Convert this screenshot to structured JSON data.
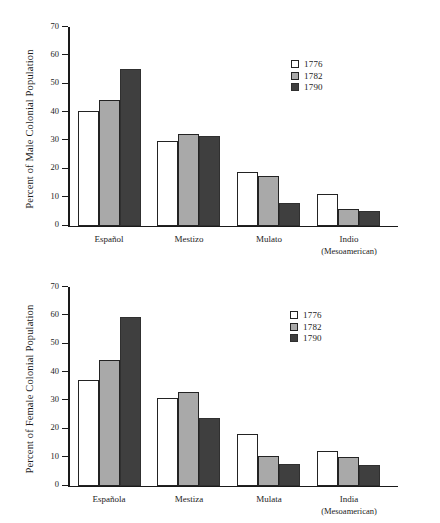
{
  "figure": {
    "background": "#ffffff",
    "series_colors": [
      "#ffffff",
      "#a9a9a9",
      "#3f3f3f"
    ]
  },
  "chart_data": [
    {
      "type": "bar",
      "id": "male",
      "title": "",
      "xlabel": "",
      "ylabel": "Percent of Male Colonial Population",
      "ylim": [
        0,
        70
      ],
      "yticks": [
        0,
        10,
        20,
        30,
        40,
        50,
        60,
        70
      ],
      "grid": false,
      "legend_position": "upper right",
      "categories": [
        "Español",
        "Mestizo",
        "Mulato",
        "Indio"
      ],
      "category_sublabels": [
        "",
        "",
        "",
        "(Mesoamerican)"
      ],
      "series": [
        {
          "name": "1776",
          "color": "#ffffff",
          "values": [
            40.5,
            29.9,
            18.7,
            11.0
          ]
        },
        {
          "name": "1782",
          "color": "#a9a9a9",
          "values": [
            44.3,
            32.3,
            17.6,
            5.7
          ]
        },
        {
          "name": "1790",
          "color": "#3f3f3f",
          "values": [
            55.3,
            31.5,
            8.0,
            5.0
          ]
        }
      ]
    },
    {
      "type": "bar",
      "id": "female",
      "title": "",
      "xlabel": "",
      "ylabel": "Percent of Female Colonial Population",
      "ylim": [
        0,
        70
      ],
      "yticks": [
        0,
        10,
        20,
        30,
        40,
        50,
        60,
        70
      ],
      "grid": false,
      "legend_position": "upper right",
      "categories": [
        "Española",
        "Mestiza",
        "Mulata",
        "India"
      ],
      "category_sublabels": [
        "",
        "",
        "",
        "(Mesoamerican)"
      ],
      "series": [
        {
          "name": "1776",
          "color": "#ffffff",
          "values": [
            37.3,
            30.7,
            18.2,
            12.0
          ]
        },
        {
          "name": "1782",
          "color": "#a9a9a9",
          "values": [
            44.2,
            33.0,
            10.5,
            10.2
          ]
        },
        {
          "name": "1790",
          "color": "#3f3f3f",
          "values": [
            59.5,
            23.7,
            7.5,
            7.2
          ]
        }
      ]
    }
  ]
}
